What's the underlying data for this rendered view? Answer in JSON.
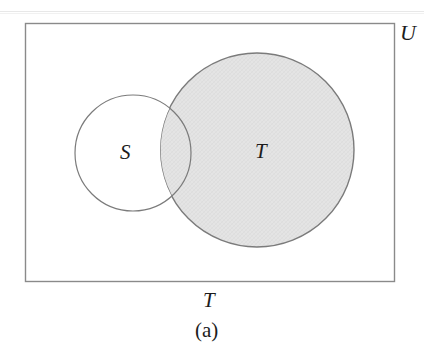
{
  "figure": {
    "domain_kind": "venn-diagram",
    "caption": "(a)",
    "bottom_label": "T",
    "universe_label": "U",
    "canvas": {
      "width": 424,
      "height": 355,
      "background": "#ffffff"
    },
    "colors": {
      "stroke": "#7b7b7b",
      "rect_stroke": "#8a8a8a",
      "shaded_fill": "#e3e3e3",
      "unshaded_fill": "#ffffff",
      "text": "#1c1c1c"
    },
    "universe_rect": {
      "name": "U",
      "x": 25,
      "y": 23,
      "width": 369,
      "height": 258,
      "fill": "#ffffff",
      "stroke": "#8a8a8a",
      "stroke_width": 1.4
    },
    "sets": [
      {
        "name": "S",
        "label": "S",
        "cx": 133,
        "cy": 153,
        "r": 58,
        "shaded": false,
        "fill": "#ffffff",
        "stroke": "#7b7b7b",
        "stroke_width": 1.2,
        "label_x": 127,
        "label_y": 153
      },
      {
        "name": "T",
        "label": "T",
        "cx": 257,
        "cy": 150,
        "r": 97,
        "shaded": true,
        "fill": "#e3e3e3",
        "stroke": "#7b7b7b",
        "stroke_width": 1.4,
        "label_x": 263,
        "label_y": 151
      }
    ],
    "shading_note": "set T is shaded; set S is unshaded; overlap region of S and T is shaded"
  }
}
